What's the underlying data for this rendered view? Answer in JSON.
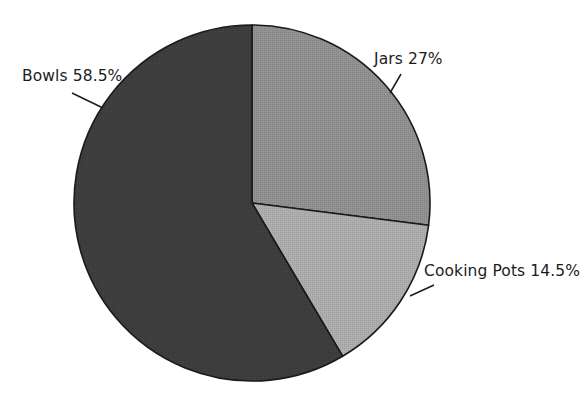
{
  "chart_data": {
    "type": "pie",
    "title": "",
    "subtitle": "",
    "xlabel": "",
    "ylabel": "",
    "grid": false,
    "legend_position": "none",
    "label_style": "outside-with-leader-lines",
    "start_angle_deg": 0,
    "direction": "clockwise",
    "background_color": "#ffffff",
    "outline_color": "#1a1a1a",
    "categories": [
      "Jars",
      "Cooking Pots",
      "Bowls"
    ],
    "values": [
      27,
      14.5,
      58.5
    ],
    "units": "%",
    "slices": [
      {
        "name": "Jars",
        "value": 27,
        "label": "Jars 27%",
        "color": "#8f8f8f",
        "start_deg": 0,
        "end_deg": 97.2
      },
      {
        "name": "Cooking Pots",
        "value": 14.5,
        "label": "Cooking Pots 14.5%",
        "color": "#ababab",
        "start_deg": 97.2,
        "end_deg": 149.4
      },
      {
        "name": "Bowls",
        "value": 58.5,
        "label": "Bowls 58.5%",
        "color": "#3d3d3d",
        "start_deg": 149.4,
        "end_deg": 360
      }
    ]
  },
  "labels": {
    "bowls": "Bowls 58.5%",
    "jars": "Jars 27%",
    "cooking_pots": "Cooking Pots 14.5%"
  }
}
